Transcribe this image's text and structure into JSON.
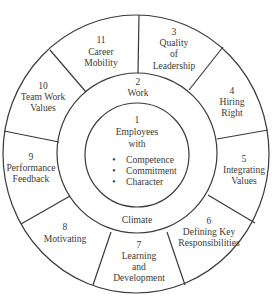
{
  "colors": {
    "line": "#3a3a3a",
    "text": "#3a3a3a",
    "background": "#ffffff"
  },
  "core": {
    "number": "1",
    "title_line1": "Employees",
    "title_line2": "with",
    "bullets": [
      "Competence",
      "Commitment",
      "Character"
    ]
  },
  "middle_ring": {
    "top": {
      "number": "2",
      "label": "Work"
    },
    "bottom": {
      "label": "Climate"
    }
  },
  "outer_segments": [
    {
      "number": "3",
      "lines": [
        "Quality",
        "of",
        "Leadership"
      ]
    },
    {
      "number": "4",
      "lines": [
        "Hiring",
        "Right"
      ]
    },
    {
      "number": "5",
      "lines": [
        "Integrating",
        "Values"
      ]
    },
    {
      "number": "6",
      "lines": [
        "Defining Key",
        "Responsibilities"
      ]
    },
    {
      "number": "7",
      "lines": [
        "Learning",
        "and",
        "Development"
      ]
    },
    {
      "number": "8",
      "lines": [
        "Motivating"
      ]
    },
    {
      "number": "9",
      "lines": [
        "Performance",
        "Feedback"
      ]
    },
    {
      "number": "10",
      "lines": [
        "Team Work",
        "Values"
      ]
    },
    {
      "number": "11",
      "lines": [
        "Career",
        "Mobility"
      ]
    }
  ],
  "bullet_glyph": "•"
}
